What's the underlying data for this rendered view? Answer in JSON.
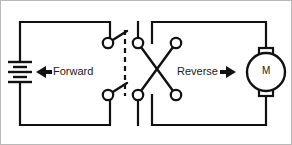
{
  "diagram": {
    "stroke_color": "#111111",
    "frame_color": "#b9b9b9",
    "background": "#ffffff",
    "labels": {
      "forward": "Forward",
      "reverse": "Reverse",
      "motor": "M"
    },
    "arrows": {
      "forward_direction": "left",
      "reverse_direction": "right"
    },
    "components": {
      "battery": {
        "name": "battery",
        "plates": 4,
        "orientation": "vertical",
        "position": {
          "x": 20,
          "y": 72
        }
      },
      "motor": {
        "name": "motor",
        "symbol": "M",
        "position": {
          "x": 266,
          "y": 72
        },
        "radius": 19
      },
      "switch": {
        "name": "dpdt-reversing-switch",
        "poles": 2,
        "throws": 2,
        "terminals": [
          {
            "id": "t1",
            "x": 108,
            "y": 43,
            "role": "left-top-pole"
          },
          {
            "id": "t2",
            "x": 138,
            "y": 43,
            "role": "upper-inner-contact"
          },
          {
            "id": "t3",
            "x": 176,
            "y": 43,
            "role": "upper-outer-contact"
          },
          {
            "id": "t4",
            "x": 108,
            "y": 95,
            "role": "left-bottom-pole"
          },
          {
            "id": "t5",
            "x": 138,
            "y": 95,
            "role": "lower-inner-contact"
          },
          {
            "id": "t6",
            "x": 176,
            "y": 95,
            "role": "lower-outer-contact"
          }
        ],
        "blades": [
          {
            "from": "t1",
            "to_point": {
              "x": 126,
              "y": 31
            }
          },
          {
            "from": "t4",
            "to_point": {
              "x": 126,
              "y": 83
            }
          }
        ],
        "cross_links": [
          {
            "from": "t2",
            "to": "t6"
          },
          {
            "from": "t5",
            "to": "t3"
          }
        ],
        "actuator_linkage": {
          "x": 125,
          "y_top": 30,
          "y_bottom": 96,
          "style": "dashed"
        }
      }
    },
    "wiring": {
      "left_loop": {
        "x_left": 20,
        "x_right": 110,
        "y_top": 22,
        "y_bottom": 125
      },
      "right_loop": {
        "x_left": 152,
        "x_right": 266,
        "y_top": 22,
        "y_bottom": 125
      },
      "left_branch_x": 138,
      "right_branch_x": 176
    }
  }
}
